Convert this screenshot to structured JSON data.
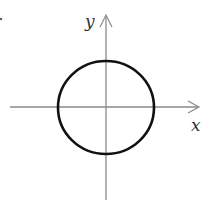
{
  "diagram": {
    "title": "",
    "x_axis_label": "x",
    "y_axis_label": "y",
    "shape": "circle",
    "colors": {
      "axis": "#8a8a8a",
      "curve": "#111111",
      "label": "#333333"
    }
  }
}
